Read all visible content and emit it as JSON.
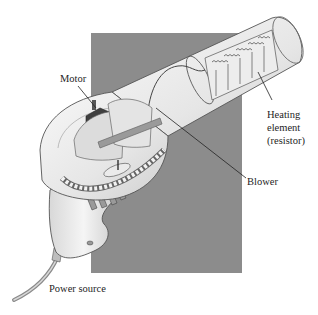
{
  "figure": {
    "backdrop_color": "#8c8c8c",
    "labels": {
      "motor": "Motor",
      "heating_line1": "Heating",
      "heating_line2": "element",
      "heating_line3": "(resistor)",
      "blower": "Blower",
      "power_source": "Power source"
    }
  }
}
